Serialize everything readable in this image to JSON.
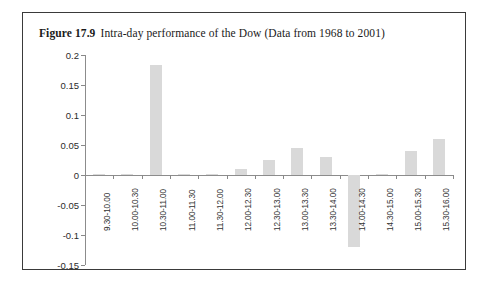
{
  "figure": {
    "number": "Figure 17.9",
    "caption": "Intra-day performance of the Dow (Data from 1968 to 2001)"
  },
  "colors": {
    "bar_fill": "#d9d9d9",
    "label_highlight": "#dedede",
    "axis": "#8c8c8c",
    "frame": "#3a3a3a",
    "text": "#1a1a1a"
  },
  "chart_data": {
    "type": "bar",
    "title": "Intra-day performance of the Dow (Data from 1968 to 2001)",
    "xlabel": "",
    "ylabel": "",
    "ylim": [
      -0.15,
      0.2
    ],
    "yticks": [
      0.2,
      0.15,
      0.1,
      0.05,
      0,
      -0.05,
      -0.1,
      -0.15
    ],
    "ytick_labels": [
      "0.2",
      "0.15",
      "0.1",
      "0.05",
      "0",
      "-0.05",
      "-0.1",
      "-0.15"
    ],
    "grid": false,
    "legend": null,
    "categories": [
      "9.30-10.00",
      "10.00-10.30",
      "10.30-11.00",
      "11.00-11.30",
      "11.30-12.00",
      "12.00-12.30",
      "12.30-13.00",
      "13.00-13.30",
      "13.30-14.00",
      "14.00-14.30",
      "14.30-15.00",
      "15.00-15.30",
      "15.30-16.00"
    ],
    "values": [
      0.002,
      0.002,
      0.183,
      0.001,
      0.001,
      0.01,
      0.025,
      0.045,
      0.03,
      -0.12,
      0.002,
      0.04,
      0.06
    ]
  }
}
